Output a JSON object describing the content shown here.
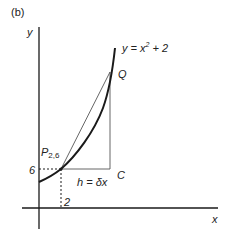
{
  "figure": {
    "panel_label": "(b)",
    "axes": {
      "x_label": "x",
      "y_label": "y"
    },
    "curve": {
      "equation_lhs": "y = x",
      "equation_exponent": "2",
      "equation_rhs": " + 2"
    },
    "points": {
      "P": {
        "name": "P",
        "subscript": "2,6"
      },
      "Q": {
        "name": "Q"
      },
      "C": {
        "name": "C"
      }
    },
    "ticks": {
      "y_value": "6",
      "x_value": "2"
    },
    "increment_label": "h = δx",
    "colors": {
      "line": "#1a1a1a",
      "thin_line": "#555555",
      "background": "#ffffff"
    }
  }
}
